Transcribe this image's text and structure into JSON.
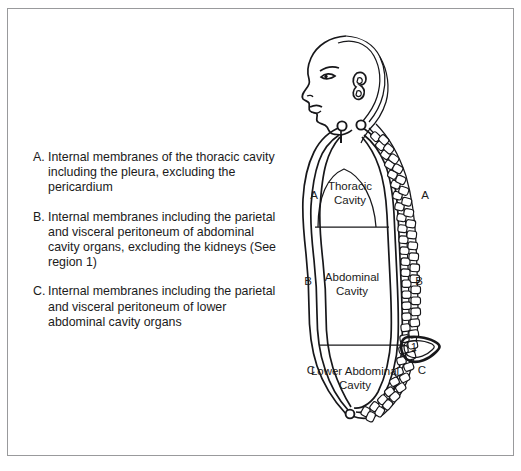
{
  "figure": {
    "title_alt": "Body cavities and serous membrane regions diagram",
    "legend": [
      {
        "marker": "A.",
        "text": "Internal membranes of the thoracic cavity including the pleura, excluding the pericardium"
      },
      {
        "marker": "B.",
        "text": "Internal membranes including the parietal and visceral peritoneum of abdominal cavity organs, excluding the kidneys (See region 1)"
      },
      {
        "marker": "C.",
        "text": "Internal membranes including the parietal and visceral peritoneum of lower abdominal cavity organs"
      }
    ],
    "cavities": [
      {
        "line1": "Thoracic",
        "line2": "Cavity"
      },
      {
        "line1": "Abdominal",
        "line2": "Cavity"
      },
      {
        "line1": "Lower Abdominal",
        "line2": "Cavity"
      }
    ],
    "region_letters": {
      "thoracic_left": "A",
      "thoracic_right": "A",
      "abdominal_left": "B",
      "abdominal_right": "B",
      "lower_left": "C",
      "lower_right": "C"
    },
    "kidney_region": "1",
    "colors": {
      "ink": "#17171a",
      "text": "#1b1b1b",
      "frame": "#999a9c",
      "background": "#ffffff"
    }
  }
}
